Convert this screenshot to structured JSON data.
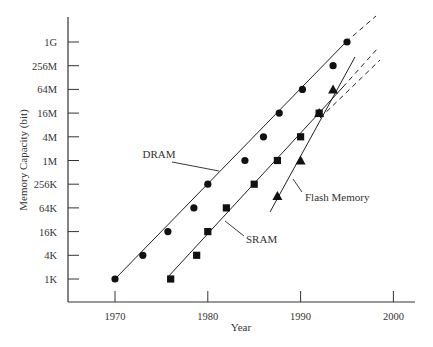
{
  "chart_data": {
    "type": "scatter",
    "title": "",
    "xlabel": "Year",
    "ylabel": "Memory Capacity (bit)",
    "xlim": [
      1964,
      2003
    ],
    "x_ticks": [
      "1970",
      "1980",
      "1990",
      "2000"
    ],
    "y_scale": "log4",
    "y_ticks": [
      "1K",
      "4K",
      "16K",
      "64K",
      "256K",
      "1M",
      "4M",
      "16M",
      "64M",
      "256M",
      "1G"
    ],
    "grid": false,
    "legend": "inline labels",
    "series": [
      {
        "name": "DRAM",
        "marker": "circle",
        "points": [
          {
            "x": 1970,
            "y": "1K"
          },
          {
            "x": 1973,
            "y": "4K"
          },
          {
            "x": 1975.7,
            "y": "16K"
          },
          {
            "x": 1978.5,
            "y": "64K"
          },
          {
            "x": 1980,
            "y": "256K"
          },
          {
            "x": 1984,
            "y": "1M"
          },
          {
            "x": 1986,
            "y": "4M"
          },
          {
            "x": 1987.7,
            "y": "16M"
          },
          {
            "x": 1990.2,
            "y": "64M"
          },
          {
            "x": 1993.5,
            "y": "256M"
          },
          {
            "x": 1995,
            "y": "1G"
          }
        ],
        "trend": "solid line 1970-1995, dashed extrapolation to ~1998"
      },
      {
        "name": "SRAM",
        "marker": "square",
        "points": [
          {
            "x": 1976,
            "y": "1K"
          },
          {
            "x": 1978.8,
            "y": "4K"
          },
          {
            "x": 1980,
            "y": "16K"
          },
          {
            "x": 1982,
            "y": "64K"
          },
          {
            "x": 1985,
            "y": "256K"
          },
          {
            "x": 1987.5,
            "y": "1M"
          },
          {
            "x": 1990,
            "y": "4M"
          },
          {
            "x": 1992,
            "y": "16M"
          }
        ],
        "trend": "solid line 1976-1993, dashed extrapolation to ~1998"
      },
      {
        "name": "Flash Memory",
        "marker": "triangle",
        "points": [
          {
            "x": 1987.5,
            "y": "128K"
          },
          {
            "x": 1990,
            "y": "1M"
          },
          {
            "x": 1992,
            "y": "16M"
          },
          {
            "x": 1993.5,
            "y": "64M"
          }
        ],
        "trend": "solid line 1987-1995, dashed extrapolation to ~1998"
      }
    ],
    "annotations": [
      "DRAM",
      "SRAM",
      "Flash Memory"
    ]
  }
}
